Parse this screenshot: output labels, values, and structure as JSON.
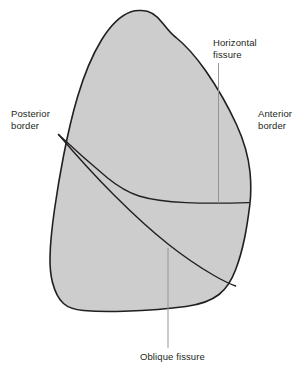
{
  "figure": {
    "background_color": "#ffffff"
  },
  "organ": {
    "name": "lung-outline",
    "fill_color": "#cdcdcd",
    "stroke_color": "#231f20",
    "stroke_width": 1.6
  },
  "fissures": {
    "horizontal": {
      "name": "horizontal-fissure",
      "stroke_color": "#231f20"
    },
    "oblique": {
      "name": "oblique-fissure",
      "stroke_color": "#231f20"
    }
  },
  "leader_lines": {
    "color": "#939598",
    "width": 1
  },
  "labels": {
    "posterior_border": {
      "line1": "Posterior",
      "line2": "border"
    },
    "anterior_border": {
      "line1": "Anterior",
      "line2": "border"
    },
    "horizontal_fissure": {
      "line1": "Horizontal",
      "line2": "fissure"
    },
    "oblique_fissure": {
      "line1": "Oblique fissure"
    }
  }
}
